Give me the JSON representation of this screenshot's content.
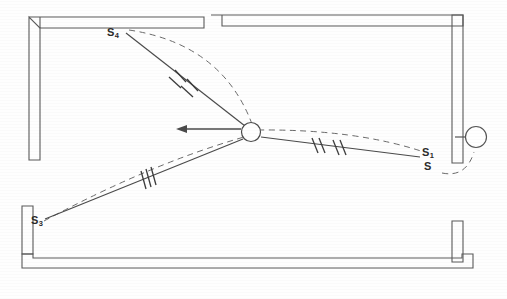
{
  "figure": {
    "background_color": "#fefefe",
    "ink_color": "#4a4a4a",
    "width": 507,
    "height": 299
  },
  "labels": {
    "s4": {
      "base": "S",
      "subscript": "4",
      "x": 107,
      "y": 26
    },
    "s3": {
      "base": "S",
      "subscript": "3",
      "x": 31,
      "y": 214
    },
    "s1": {
      "base": "S",
      "subscript": "1",
      "x": 422,
      "y": 146
    },
    "s": {
      "base": "S",
      "subscript": "",
      "x": 424,
      "y": 160
    }
  },
  "hub": {
    "name": "center-pivot",
    "cx": 251,
    "cy": 132,
    "r": 9.5
  },
  "wall_joint": {
    "name": "right-wall-joint",
    "cx": 476,
    "cy": 137,
    "r": 10.5,
    "stub_from_x": 455,
    "stub_to_x": 465
  },
  "velocity_arrow": {
    "name": "velocity-vector",
    "from_x": 241,
    "from_y": 129,
    "to_x": 178,
    "to_y": 129,
    "direction": "left"
  },
  "links": [
    {
      "name": "link-s4",
      "label_ref": "s4",
      "tick_count": 2,
      "from_x": 126,
      "from_y": 33,
      "to_x": 245,
      "to_y": 126,
      "tick_at_x": 182,
      "tick_at_y": 78
    },
    {
      "name": "link-s3",
      "label_ref": "s3",
      "tick_count": 3,
      "from_x": 45,
      "from_y": 219,
      "to_x": 243,
      "to_y": 139,
      "tick_at_x": 146,
      "tick_at_y": 180
    },
    {
      "name": "link-s1",
      "label_ref": "s1",
      "tick_count": 4,
      "from_x": 261,
      "from_y": 137,
      "to_x": 420,
      "to_y": 157,
      "tick_at_x": 318,
      "tick_at_y": 145
    }
  ],
  "trajectories": [
    {
      "name": "trajectory-s4",
      "style": "dashed"
    },
    {
      "name": "trajectory-s3",
      "style": "dashed"
    },
    {
      "name": "trajectory-s1",
      "style": "dashed"
    },
    {
      "name": "trajectory-joint-loop",
      "style": "dashed"
    }
  ],
  "walls": [
    {
      "name": "wall-top-left",
      "orientation": "horizontal"
    },
    {
      "name": "wall-top-right",
      "orientation": "horizontal"
    },
    {
      "name": "wall-left-upper",
      "orientation": "vertical"
    },
    {
      "name": "wall-left-lower",
      "orientation": "vertical"
    },
    {
      "name": "wall-right",
      "orientation": "vertical"
    },
    {
      "name": "wall-bottom",
      "orientation": "horizontal"
    }
  ]
}
